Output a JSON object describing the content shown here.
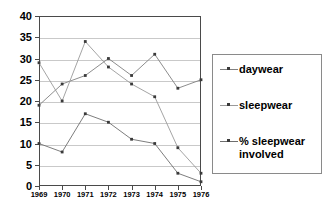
{
  "chart_data": {
    "type": "line",
    "title": "",
    "xlabel": "",
    "ylabel": "",
    "categories": [
      "1969",
      "1970",
      "1971",
      "1972",
      "1973",
      "1974",
      "1975",
      "1976"
    ],
    "ylim": [
      0,
      40
    ],
    "ytick_values": [
      0,
      5,
      10,
      15,
      20,
      25,
      30,
      35,
      40
    ],
    "ytick_labels": [
      "0",
      "5",
      "10",
      "15",
      "20",
      "25",
      "30",
      "35",
      "40"
    ],
    "grid": true,
    "legend_position": "right",
    "series": [
      {
        "name": "daywear",
        "color": "#808080",
        "values": [
          19,
          24,
          26,
          30,
          26,
          31,
          23,
          25
        ]
      },
      {
        "name": "sleepwear",
        "color": "#9a9a9a",
        "values": [
          29,
          20,
          34,
          28,
          24,
          21,
          9,
          3
        ]
      },
      {
        "name": "% sleepwear\ninvolved",
        "color": "#6e6e6e",
        "values": [
          10,
          8,
          17,
          15,
          11,
          10,
          3,
          1
        ]
      }
    ]
  },
  "legend": {
    "items": [
      {
        "label": "daywear"
      },
      {
        "label": "sleepwear"
      },
      {
        "label": "% sleepwear\ninvolved"
      }
    ]
  }
}
